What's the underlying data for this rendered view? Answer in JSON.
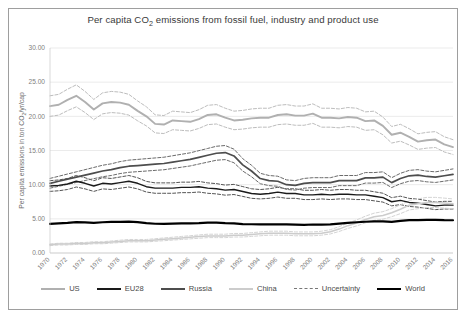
{
  "figure": {
    "border_color": "#9e9e9e",
    "background": "#ffffff",
    "caption_sliver": ""
  },
  "chart_data": {
    "type": "line",
    "title": "Per capita CO2 emissions from fossil fuel, industry and product use",
    "title_main": "Per capita CO",
    "title_sub": "2",
    "title_rest": " emissions from fossil fuel, industry and product use",
    "xlabel": "",
    "ylabel": "Per capita emissions in ton CO2/yr/cap",
    "ylabel_main": "Per capita emissions in ton CO",
    "ylabel_sub": "2",
    "ylabel_rest": "/yr/cap",
    "ylim": [
      0,
      30
    ],
    "yticks": [
      0,
      5,
      10,
      15,
      20,
      25,
      30
    ],
    "ytick_labels": [
      "0.00",
      "5.00",
      "10.00",
      "15.00",
      "20.00",
      "25.00",
      "30.00"
    ],
    "xlim": [
      1970,
      2016
    ],
    "xticks": [
      1970,
      1972,
      1974,
      1976,
      1978,
      1980,
      1982,
      1984,
      1986,
      1988,
      1990,
      1992,
      1994,
      1996,
      1998,
      2000,
      2002,
      2004,
      2006,
      2008,
      2010,
      2012,
      2014,
      2016
    ],
    "xtick_labels": [
      "1970",
      "1972",
      "1974",
      "1976",
      "1978",
      "1980",
      "1982",
      "1984",
      "1986",
      "1988",
      "1990",
      "1992",
      "1994",
      "1996",
      "1998",
      "2000",
      "2002",
      "2004",
      "2006",
      "2008",
      "2010",
      "2012",
      "2014",
      "2016"
    ],
    "grid": "horizontal",
    "legend_position": "bottom",
    "x": [
      1970,
      1971,
      1972,
      1973,
      1974,
      1975,
      1976,
      1977,
      1978,
      1979,
      1980,
      1981,
      1982,
      1983,
      1984,
      1985,
      1986,
      1987,
      1988,
      1989,
      1990,
      1991,
      1992,
      1993,
      1994,
      1995,
      1996,
      1997,
      1998,
      1999,
      2000,
      2001,
      2002,
      2003,
      2004,
      2005,
      2006,
      2007,
      2008,
      2009,
      2010,
      2011,
      2012,
      2013,
      2014,
      2015,
      2016
    ],
    "series": [
      {
        "name": "US",
        "color": "#b0b0b0",
        "width": 1.9,
        "values": [
          21.5,
          21.7,
          22.4,
          23.0,
          22.1,
          21.0,
          21.9,
          22.1,
          22.0,
          21.7,
          20.8,
          20.0,
          18.9,
          18.8,
          19.4,
          19.3,
          19.2,
          19.6,
          20.2,
          20.3,
          19.8,
          19.4,
          19.5,
          19.7,
          19.8,
          19.8,
          20.2,
          20.3,
          20.1,
          20.1,
          20.4,
          19.8,
          19.8,
          19.7,
          19.9,
          19.8,
          19.3,
          19.4,
          18.6,
          17.3,
          17.6,
          17.0,
          16.3,
          16.5,
          16.6,
          15.9,
          15.5
        ]
      },
      {
        "name": "EU28",
        "color": "#1a1a1a",
        "width": 1.4,
        "values": [
          9.8,
          9.9,
          10.1,
          10.5,
          10.2,
          9.8,
          10.2,
          10.1,
          10.3,
          10.5,
          10.2,
          9.7,
          9.5,
          9.5,
          9.5,
          9.6,
          9.6,
          9.7,
          9.5,
          9.4,
          9.2,
          9.3,
          9.0,
          8.7,
          8.6,
          8.7,
          8.9,
          8.7,
          8.7,
          8.5,
          8.5,
          8.6,
          8.5,
          8.6,
          8.6,
          8.5,
          8.5,
          8.3,
          8.1,
          7.5,
          7.7,
          7.4,
          7.3,
          7.1,
          6.9,
          7.0,
          7.0
        ]
      },
      {
        "name": "Russia",
        "color": "#4d4d4d",
        "width": 1.7,
        "values": [
          10.2,
          10.5,
          10.8,
          11.1,
          11.4,
          11.7,
          12.0,
          12.2,
          12.5,
          12.7,
          12.8,
          12.9,
          13.0,
          13.1,
          13.3,
          13.5,
          13.7,
          14.0,
          14.3,
          14.6,
          14.7,
          14.2,
          12.9,
          12.0,
          10.9,
          10.6,
          10.5,
          10.0,
          9.9,
          10.2,
          10.3,
          10.3,
          10.3,
          10.6,
          10.6,
          10.6,
          11.0,
          11.0,
          11.1,
          10.3,
          10.9,
          11.3,
          11.4,
          11.2,
          11.1,
          11.3,
          11.5
        ]
      },
      {
        "name": "China",
        "color": "#cccccc",
        "width": 1.5,
        "values": [
          1.2,
          1.3,
          1.3,
          1.4,
          1.4,
          1.5,
          1.5,
          1.6,
          1.7,
          1.8,
          1.8,
          1.8,
          1.9,
          2.0,
          2.1,
          2.2,
          2.3,
          2.4,
          2.5,
          2.5,
          2.5,
          2.6,
          2.6,
          2.7,
          2.8,
          2.9,
          2.9,
          2.9,
          2.8,
          2.8,
          2.8,
          2.9,
          3.1,
          3.5,
          4.0,
          4.4,
          4.9,
          5.3,
          5.5,
          5.9,
          6.4,
          7.0,
          7.2,
          7.4,
          7.4,
          7.3,
          7.2
        ]
      },
      {
        "name": "World",
        "color": "#000000",
        "width": 2.2,
        "values": [
          4.25,
          4.33,
          4.4,
          4.52,
          4.48,
          4.4,
          4.5,
          4.55,
          4.55,
          4.6,
          4.52,
          4.36,
          4.28,
          4.26,
          4.31,
          4.33,
          4.34,
          4.38,
          4.45,
          4.45,
          4.37,
          4.33,
          4.24,
          4.21,
          4.18,
          4.19,
          4.21,
          4.2,
          4.15,
          4.12,
          4.17,
          4.16,
          4.18,
          4.3,
          4.42,
          4.5,
          4.57,
          4.62,
          4.64,
          4.55,
          4.7,
          4.8,
          4.82,
          4.85,
          4.84,
          4.8,
          4.79
        ]
      }
    ],
    "uncertainty": {
      "name": "Uncertainty",
      "color": "#5a5a5a",
      "width": 1.0,
      "style": "dashed",
      "description": "Dashed upper and lower bounds drawn around US, EU28, Russia and China",
      "bounds": [
        {
          "series": "US",
          "rel_upper": 1.07,
          "rel_lower": 0.93,
          "color": "#bdbdbd"
        },
        {
          "series": "EU28",
          "rel_upper": 1.08,
          "rel_lower": 0.92,
          "color": "#555555"
        },
        {
          "series": "Russia",
          "rel_upper": 1.07,
          "rel_lower": 0.93,
          "color": "#6b6b6b"
        },
        {
          "series": "China",
          "rel_upper": 1.1,
          "rel_lower": 0.9,
          "color": "#d4d4d4"
        }
      ]
    },
    "legend": [
      {
        "label": "US",
        "color": "#b0b0b0",
        "width": 2.0,
        "dashed": false
      },
      {
        "label": "EU28",
        "color": "#1a1a1a",
        "width": 2.2,
        "dashed": false
      },
      {
        "label": "Russia",
        "color": "#4d4d4d",
        "width": 2.2,
        "dashed": false
      },
      {
        "label": "China",
        "color": "#cccccc",
        "width": 2.0,
        "dashed": false
      },
      {
        "label": "Uncertainty",
        "color": "#777777",
        "width": 1.2,
        "dashed": true
      },
      {
        "label": "World",
        "color": "#000000",
        "width": 2.6,
        "dashed": false
      }
    ]
  }
}
